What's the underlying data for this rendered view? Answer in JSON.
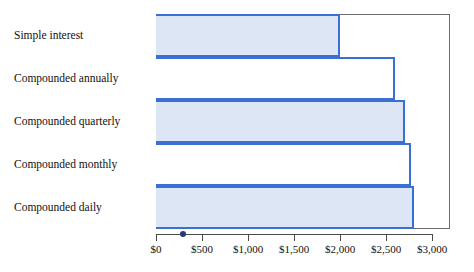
{
  "chart_data": {
    "type": "bar",
    "orientation": "horizontal",
    "title": "",
    "subtitle": "",
    "xlabel": "",
    "ylabel": "",
    "categories": [
      "Simple interest",
      "Compounded annually",
      "Compounded quarterly",
      "Compounded monthly",
      "Compounded daily"
    ],
    "values": [
      2000,
      2600,
      2710,
      2770,
      2800
    ],
    "xlim": [
      0,
      3000
    ],
    "xticks": [
      0,
      500,
      1000,
      1500,
      2000,
      2500,
      3000
    ],
    "xtick_labels": [
      "$0",
      "$500",
      "$1,000",
      "$1,500",
      "$2,000",
      "$2,500",
      "$3,000"
    ],
    "grid": false,
    "legend": "none",
    "bar_styles": [
      "filled",
      "hollow",
      "filled",
      "hollow",
      "filled"
    ],
    "annotations": [
      {
        "name": "axis-marker-dot",
        "x_value": 290,
        "shape": "dot"
      }
    ],
    "colors": {
      "bar_fill": "#dce6f5",
      "bar_hollow_fill": "#ffffff",
      "bar_border": "#3b6fd4",
      "plot_border": "#6b6b6b",
      "axis_line": "#4a4a4a",
      "marker_dot": "#26387f",
      "text": "#111111",
      "background": "#ffffff"
    }
  }
}
